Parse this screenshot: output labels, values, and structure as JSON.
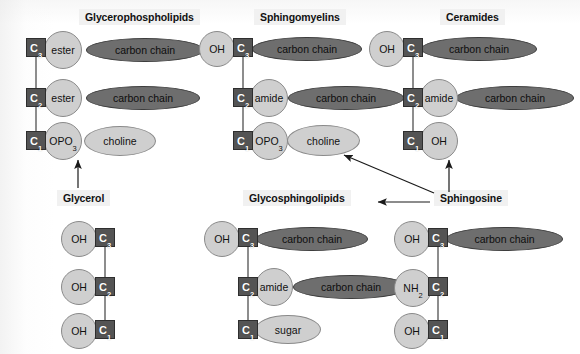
{
  "figure": {
    "background_color": "#ffffff",
    "carbon_box_color": "#545454",
    "light_shape_color": "#cfcfcf",
    "dark_shape_color": "#6e6e6e",
    "bond_color": "#8d8d8d"
  },
  "titles": {
    "glycerophospholipids": "Glycerophospholipids",
    "sphingomyelins": "Sphingomyelins",
    "ceramides": "Ceramides",
    "glycerol": "Glycerol",
    "glycosphingolipids": "Glycosphingolipids",
    "sphingosine": "Sphingosine"
  },
  "labels": {
    "c3": "C3",
    "c2": "C2",
    "c1": "C1",
    "ester": "ester",
    "amide": "amide",
    "opo3": "OPO3",
    "oh": "OH",
    "nh2": "NH2",
    "choline": "choline",
    "sugar": "sugar",
    "carbon_chain": "carbon chain"
  },
  "panels": {
    "glycerophospholipids": {
      "title": "Glycerophospholipids",
      "rows": [
        {
          "carbon": "C3",
          "substituent": "ester",
          "tail": "carbon chain"
        },
        {
          "carbon": "C2",
          "substituent": "ester",
          "tail": "carbon chain"
        },
        {
          "carbon": "C1",
          "substituent": "OPO3",
          "tail": "choline"
        }
      ]
    },
    "sphingomyelins": {
      "title": "Sphingomyelins",
      "rows": [
        {
          "left": "OH",
          "carbon": "C3",
          "tail": "carbon chain"
        },
        {
          "carbon": "C2",
          "substituent": "amide",
          "tail": "carbon chain"
        },
        {
          "carbon": "C1",
          "substituent": "OPO3",
          "tail": "choline"
        }
      ]
    },
    "ceramides": {
      "title": "Ceramides",
      "rows": [
        {
          "left": "OH",
          "carbon": "C3",
          "tail": "carbon chain"
        },
        {
          "carbon": "C2",
          "substituent": "amide",
          "tail": "carbon chain"
        },
        {
          "carbon": "C1",
          "substituent": "OH"
        }
      ]
    },
    "glycerol": {
      "title": "Glycerol",
      "rows": [
        {
          "left": "OH",
          "carbon": "C3"
        },
        {
          "left": "OH",
          "carbon": "C2"
        },
        {
          "left": "OH",
          "carbon": "C1"
        }
      ]
    },
    "glycosphingolipids": {
      "title": "Glycosphingolipids",
      "rows": [
        {
          "left": "OH",
          "carbon": "C3",
          "tail": "carbon chain"
        },
        {
          "carbon": "C2",
          "substituent": "amide",
          "tail": "carbon chain"
        },
        {
          "carbon": "C1",
          "tail": "sugar"
        }
      ]
    },
    "sphingosine": {
      "title": "Sphingosine",
      "rows": [
        {
          "left": "OH",
          "carbon": "C3",
          "tail": "carbon chain"
        },
        {
          "left": "NH2",
          "carbon": "C2"
        },
        {
          "left": "OH",
          "carbon": "C1"
        }
      ]
    }
  },
  "arrows": [
    {
      "name": "glycerol-to-glycerophospholipids",
      "from": "Glycerol",
      "to": "Glycerophospholipids"
    },
    {
      "name": "sphingosine-to-sphingomyelins",
      "from": "Sphingosine",
      "to": "Sphingomyelins"
    },
    {
      "name": "sphingosine-to-ceramides",
      "from": "Sphingosine",
      "to": "Ceramides"
    },
    {
      "name": "sphingosine-to-glycosphingolipids",
      "from": "Sphingosine",
      "to": "Glycosphingolipids"
    }
  ]
}
